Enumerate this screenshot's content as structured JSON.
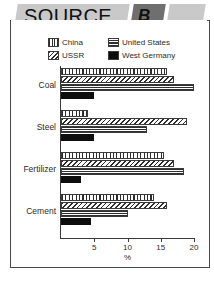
{
  "banner": {
    "title": "SOURCE",
    "letter": "B",
    "colors": {
      "light": "#c9c9c9",
      "dark": "#6f6f6f"
    }
  },
  "legend": {
    "items": [
      {
        "label": "China",
        "pattern": "vertical-stripes",
        "icon": "swatch-vertical-icon"
      },
      {
        "label": "United States",
        "pattern": "horizontal-stripes",
        "icon": "swatch-horizontal-icon"
      },
      {
        "label": "USSR",
        "pattern": "diagonal-hatch",
        "icon": "swatch-diagonal-icon"
      },
      {
        "label": "West Germany",
        "pattern": "solid-black",
        "icon": "swatch-solid-icon"
      }
    ]
  },
  "chart_data": {
    "type": "bar",
    "orientation": "horizontal",
    "title": "SOURCE B",
    "xlabel": "%",
    "ylabel": "",
    "xlim": [
      0,
      20
    ],
    "xticks": [
      0,
      5,
      10,
      15,
      20
    ],
    "xticklabels": [
      "",
      "5",
      "10",
      "15",
      "20"
    ],
    "grid": false,
    "legend_position": "top",
    "categories": [
      "Coal",
      "Steel",
      "Fertilizer",
      "Cement"
    ],
    "series": [
      {
        "name": "China",
        "values": [
          16.0,
          4.0,
          15.5,
          14.0
        ]
      },
      {
        "name": "USSR",
        "values": [
          17.0,
          19.0,
          17.0,
          16.0
        ]
      },
      {
        "name": "United States",
        "values": [
          20.0,
          13.0,
          18.5,
          10.0
        ]
      },
      {
        "name": "West Germany",
        "values": [
          5.0,
          5.0,
          3.0,
          4.5
        ]
      }
    ]
  },
  "caption": {
    "text": ""
  }
}
